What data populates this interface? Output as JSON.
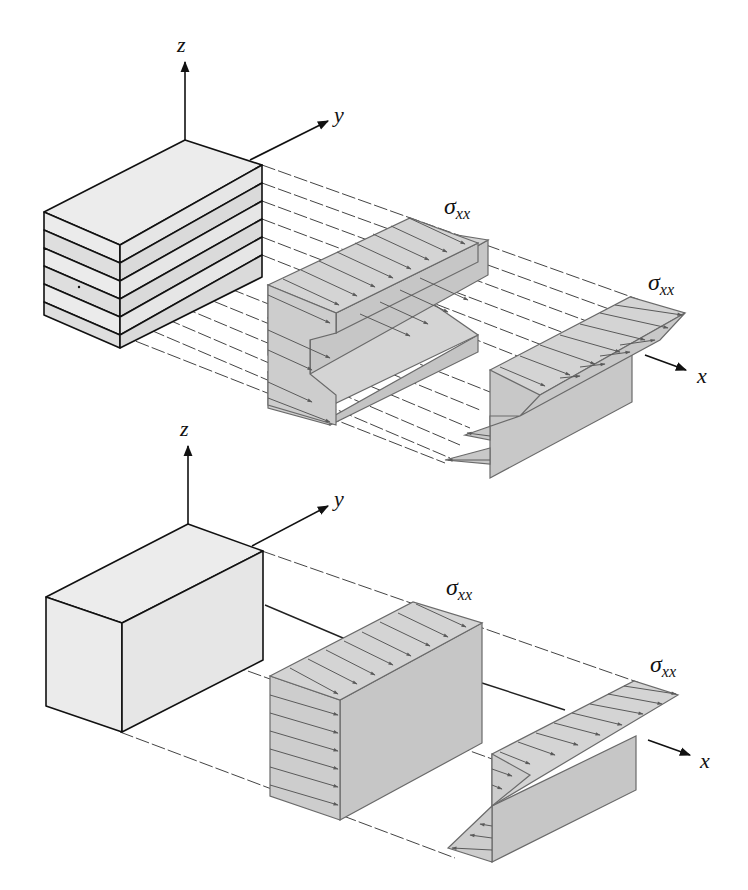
{
  "figure": {
    "colors": {
      "block_face": "#ececec",
      "block_face_alt": "#e2e2e2",
      "stress_face": "#c8c8c8",
      "stress_top": "#d2d2d2",
      "edge": "#111111",
      "stress_edge": "#6a6a6a",
      "arrow": "#5a5a5a",
      "dashed": "#444444"
    }
  },
  "top_panel": {
    "name": "laminated beam",
    "axes": {
      "z": "z",
      "y": "y",
      "x": "x"
    },
    "layers": 6,
    "stress_label_1": {
      "main": "σ",
      "sub": "xx"
    },
    "stress_label_2": {
      "main": "σ",
      "sub": "xx"
    },
    "distribution_1": "uniform per layer (independent layers)",
    "distribution_2": "linear per layer (sawtooth bending)"
  },
  "bottom_panel": {
    "name": "solid beam",
    "axes": {
      "z": "z",
      "y": "y",
      "x": "x"
    },
    "stress_label_1": {
      "main": "σ",
      "sub": "xx"
    },
    "stress_label_2": {
      "main": "σ",
      "sub": "xx"
    },
    "distribution_1": "uniform tension",
    "distribution_2": "linear bending (tension top, compression bottom)"
  }
}
